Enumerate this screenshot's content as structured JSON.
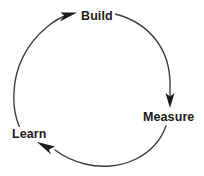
{
  "diagram": {
    "type": "cycle-loop",
    "background_color": "#ffffff",
    "stroke_color": "#3a3a3a",
    "text_color": "#1b1b1b",
    "nodes": [
      {
        "id": "build",
        "label": "Build",
        "position": "top"
      },
      {
        "id": "measure",
        "label": "Measure",
        "position": "right"
      },
      {
        "id": "learn",
        "label": "Learn",
        "position": "bottom-left"
      }
    ],
    "edges": [
      {
        "from": "learn",
        "to": "build",
        "direction": "clockwise",
        "arrow": "arrowhead-right-into-build"
      },
      {
        "from": "build",
        "to": "measure",
        "direction": "clockwise",
        "arrow": "arrowhead-down-into-measure"
      },
      {
        "from": "measure",
        "to": "learn",
        "direction": "clockwise",
        "arrow": "arrowhead-upleft-into-learn"
      }
    ]
  }
}
